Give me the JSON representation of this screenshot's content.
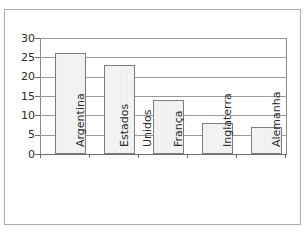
{
  "chart_data": {
    "type": "bar",
    "title": "",
    "subtitle": "",
    "xlabel": "",
    "ylabel": "",
    "categories": [
      "Argentina",
      "Estados Unidos",
      "França",
      "Inglaterra",
      "Alemanha"
    ],
    "category_lines": [
      [
        "Argentina"
      ],
      [
        "Estados",
        "Unidos"
      ],
      [
        "França"
      ],
      [
        "Inglaterra"
      ],
      [
        "Alemanha"
      ]
    ],
    "values": [
      26,
      23,
      14,
      8,
      7
    ],
    "ylim": [
      0,
      30
    ],
    "ytick_labels": [
      "30",
      "25",
      "20",
      "15",
      "10",
      "5",
      "0"
    ],
    "ytick_values": [
      30,
      25,
      20,
      15,
      10,
      5,
      0
    ],
    "grid": true,
    "legend": false,
    "legend_position": "none",
    "colors": {
      "bar_fill": "#f2f2f2",
      "bar_border": "#7d7d7d",
      "gridline": "#9b9b9b",
      "axis": "#6e6e6e",
      "text": "#2a2a2a",
      "frame": "#adadad",
      "background": "#ffffff"
    }
  },
  "axis": {
    "y_labels": [
      {
        "text": "30",
        "value": 30
      },
      {
        "text": "25",
        "value": 25
      },
      {
        "text": "20",
        "value": 20
      },
      {
        "text": "15",
        "value": 15
      },
      {
        "text": "10",
        "value": 10
      },
      {
        "text": "5",
        "value": 5
      },
      {
        "text": "0",
        "value": 0
      }
    ]
  },
  "categories": [
    {
      "line1": "Argentina",
      "line2": ""
    },
    {
      "line1": "Estados",
      "line2": "Unidos"
    },
    {
      "line1": "França",
      "line2": ""
    },
    {
      "line1": "Inglaterra",
      "line2": ""
    },
    {
      "line1": "Alemanha",
      "line2": ""
    }
  ]
}
